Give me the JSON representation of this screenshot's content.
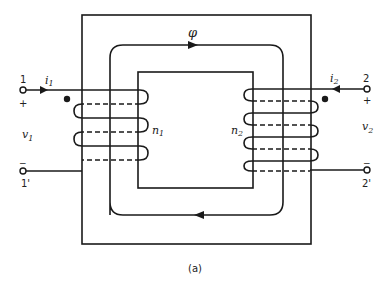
{
  "diagram": {
    "caption": "(a)",
    "flux_label": "φ",
    "primary": {
      "terminal_top": "1",
      "terminal_bottom": "1'",
      "current": "i",
      "current_sub": "1",
      "voltage": "v",
      "voltage_sub": "1",
      "turns": "n",
      "turns_sub": "1",
      "plus": "+",
      "minus": "−"
    },
    "secondary": {
      "terminal_top": "2",
      "terminal_bottom": "2'",
      "current": "i",
      "current_sub": "2",
      "voltage": "v",
      "voltage_sub": "2",
      "turns": "n",
      "turns_sub": "2",
      "plus": "+",
      "minus": "−"
    },
    "colors": {
      "line": "#1a1a1a",
      "background": "#ffffff"
    }
  }
}
